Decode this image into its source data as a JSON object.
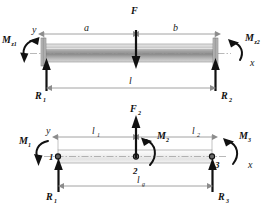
{
  "figure": {
    "background_color": "#ffffff",
    "ink_color": "#1a1a1a",
    "beam_fill_top": "#b5b5b5",
    "beam_fill_bottom": "#ededed",
    "dimension_line_color": "#8c8c8c"
  },
  "top_diagram": {
    "name": "fixed-fixed-beam-with-point-load",
    "axis": {
      "y_label": "y",
      "x_label": "x"
    },
    "beam": {
      "left_support": "fixed",
      "right_support": "fixed"
    },
    "loads": [
      {
        "name": "point-load",
        "label": "F",
        "direction": "down",
        "position_fraction": 0.62
      }
    ],
    "moments": [
      {
        "name": "left-end-moment",
        "label_base": "M",
        "label_sub": "z1",
        "sense": "counterclockwise"
      },
      {
        "name": "right-end-moment",
        "label_base": "M",
        "label_sub": "z2",
        "sense": "clockwise"
      }
    ],
    "reactions": [
      {
        "name": "left-reaction",
        "label_base": "R",
        "label_sub": "1",
        "direction": "up"
      },
      {
        "name": "right-reaction",
        "label_base": "R",
        "label_sub": "2",
        "direction": "up"
      }
    ],
    "dimensions": [
      {
        "name": "dimension-a",
        "label_base": "a",
        "label_sub": "",
        "from": "left-end",
        "to": "load-point"
      },
      {
        "name": "dimension-b",
        "label_base": "b",
        "label_sub": "",
        "from": "load-point",
        "to": "right-end"
      },
      {
        "name": "dimension-l",
        "label_base": "l",
        "label_sub": "",
        "from": "left-support",
        "to": "right-support"
      }
    ]
  },
  "bottom_diagram": {
    "name": "three-node-beam-element-model",
    "axis": {
      "y_label": "y",
      "x_label": "x"
    },
    "nodes": [
      {
        "name": "node-1",
        "label": "1"
      },
      {
        "name": "node-2",
        "label": "2"
      },
      {
        "name": "node-3",
        "label": "3"
      }
    ],
    "loads": [
      {
        "name": "nodal-force-2",
        "label_base": "F",
        "label_sub": "2",
        "direction": "up"
      }
    ],
    "moments": [
      {
        "name": "nodal-moment-1",
        "label_base": "M",
        "label_sub": "1",
        "sense": "counterclockwise"
      },
      {
        "name": "nodal-moment-2",
        "label_base": "M",
        "label_sub": "2",
        "sense": "clockwise"
      },
      {
        "name": "nodal-moment-3",
        "label_base": "M",
        "label_sub": "3",
        "sense": "clockwise"
      }
    ],
    "reactions": [
      {
        "name": "reaction-1",
        "label_base": "R",
        "label_sub": "1",
        "direction": "up"
      },
      {
        "name": "reaction-3",
        "label_base": "R",
        "label_sub": "3",
        "direction": "up"
      }
    ],
    "dimensions": [
      {
        "name": "dimension-l1",
        "label_base": "l",
        "label_sub": "1",
        "from": "node-1",
        "to": "node-2"
      },
      {
        "name": "dimension-l2",
        "label_base": "l",
        "label_sub": "2",
        "from": "node-2",
        "to": "node-3"
      },
      {
        "name": "dimension-lg",
        "label_base": "l",
        "label_sub": "g",
        "from": "node-1",
        "to": "node-3"
      }
    ]
  }
}
